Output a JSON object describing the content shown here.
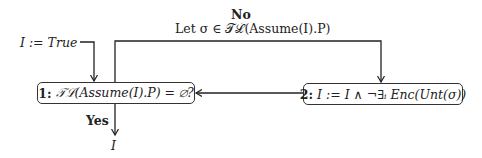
{
  "diagram": {
    "type": "flowchart",
    "init": {
      "label": "I := True"
    },
    "nodes": [
      {
        "id": "1",
        "num": "1:",
        "expr": "𝒯ℒ(Assume(I).P) = ∅?"
      },
      {
        "id": "2",
        "num": "2:",
        "expr": "I := I ∧ ¬∃ᵢ Enc(Unt(σ))"
      }
    ],
    "edges": {
      "no": {
        "title": "No",
        "text": "Let σ ∈ 𝒯ℒ(Assume(I).P)"
      },
      "yes": {
        "title": "Yes",
        "output": "I"
      }
    },
    "colors": {
      "line": "#222222",
      "background": "#ffffff"
    }
  }
}
